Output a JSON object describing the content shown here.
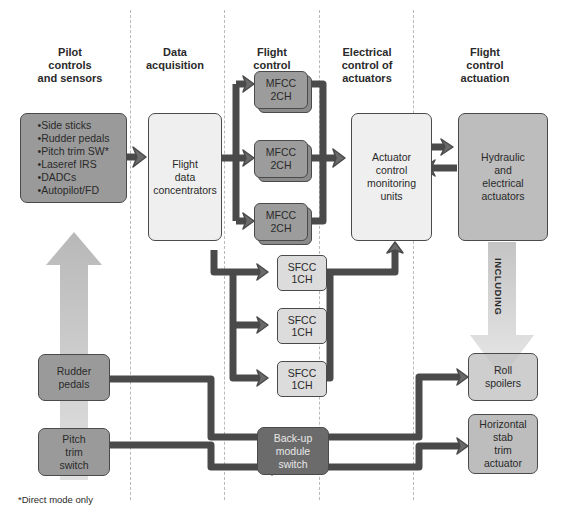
{
  "columns": [
    {
      "title": "Pilot controls and sensors",
      "lines": [
        "Pilot",
        "controls",
        "and sensors"
      ]
    },
    {
      "title": "Data acquisition",
      "lines": [
        "Data",
        "acquisition"
      ]
    },
    {
      "title": "Flight control laws",
      "lines": [
        "Flight",
        "control",
        "laws"
      ]
    },
    {
      "title": "Electrical control of actuators",
      "lines": [
        "Electrical",
        "control of",
        "actuators"
      ]
    },
    {
      "title": "Flight control actuation",
      "lines": [
        "Flight",
        "control",
        "actuation"
      ]
    }
  ],
  "pilot_inputs": {
    "items": [
      "Side sticks",
      "Rudder pedals",
      "Pitch trim SW*",
      "Laseref IRS",
      "DADCs",
      "Autopilot/FD"
    ]
  },
  "flight_data_concentrators": {
    "lines": [
      "Flight",
      "data",
      "concentrators"
    ]
  },
  "mfcc": [
    {
      "line1": "MFCC",
      "line2": "2CH"
    },
    {
      "line1": "MFCC",
      "line2": "2CH"
    },
    {
      "line1": "MFCC",
      "line2": "2CH"
    }
  ],
  "sfcc": [
    {
      "line1": "SFCC",
      "line2": "1CH"
    },
    {
      "line1": "SFCC",
      "line2": "1CH"
    },
    {
      "line1": "SFCC",
      "line2": "1CH"
    }
  ],
  "actuator_control": {
    "lines": [
      "Actuator",
      "control",
      "monitoring",
      "units"
    ]
  },
  "hydraulic_actuators": {
    "lines": [
      "Hydraulic",
      "and",
      "electrical",
      "actuators"
    ]
  },
  "including_label": "INCLUDING",
  "roll_spoilers": {
    "lines": [
      "Roll",
      "spoilers"
    ]
  },
  "horizontal_stab": {
    "lines": [
      "Horizontal",
      "stab",
      "trim",
      "actuator"
    ]
  },
  "rudder_pedals": {
    "lines": [
      "Rudder",
      "pedals"
    ]
  },
  "pitch_trim_switch": {
    "lines": [
      "Pitch",
      "trim",
      "switch"
    ]
  },
  "backup_module": {
    "lines": [
      "Back-up",
      "module",
      "switch"
    ]
  },
  "footnote": "*Direct mode only",
  "colors": {
    "dark_box": "#9a9a9a",
    "light_box": "#efefef",
    "arrow": "#666666",
    "wide_arrow": "#c4c4c4",
    "darkest_box": "#6b6b6b"
  }
}
